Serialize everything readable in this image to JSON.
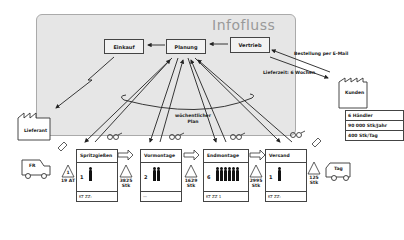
{
  "diagram": {
    "title": "Infofluss",
    "info_nodes": {
      "einkauf": "Einkauf",
      "planung": "Planung",
      "vertrieb": "Vertrieb"
    },
    "annotations": {
      "bestellung": "Bestellung per E-Mail",
      "lieferzeit": "Lieferzeit: 6 Wochen",
      "plan": "wöchentlicher Plan"
    },
    "external": {
      "supplier": "Lieferant",
      "customer": "Kunden"
    },
    "customer_table": [
      "6 Händler",
      "90 000 Stk/Jahr",
      "400 Stk/Tag"
    ],
    "trucks": {
      "left": "FR",
      "right": "Tag"
    },
    "processes": [
      {
        "name": "Spritzgießen",
        "operators": "1",
        "operator_count": 1,
        "footer": "KT  ZZ:"
      },
      {
        "name": "Vormontage",
        "operators": "2",
        "operator_count": 2,
        "footer": "—"
      },
      {
        "name": "Endmontage",
        "operators": "6",
        "operator_count": 6,
        "footer": "KT  ZZ 1"
      },
      {
        "name": "Versand",
        "operators": "1",
        "operator_count": 1,
        "footer": "KT  ZZ:"
      }
    ],
    "inventories": [
      {
        "line1": "1",
        "line2": "19 AT"
      },
      {
        "line1": "3825",
        "line2": "Stk"
      },
      {
        "line1": "1629",
        "line2": "Stk"
      },
      {
        "line1": "2995",
        "line2": "Stk"
      },
      {
        "line1": "125",
        "line2": "Stk"
      }
    ],
    "colors": {
      "panel": "#e6e6e6",
      "line": "#222222",
      "title": "#999999"
    }
  }
}
